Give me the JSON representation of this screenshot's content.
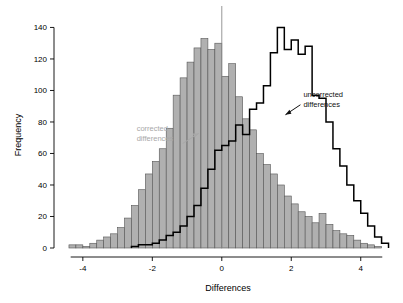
{
  "chart_data": {
    "type": "bar",
    "title": "",
    "xlabel": "Differences",
    "ylabel": "Frequency",
    "xlim": [
      -4.6,
      4.9
    ],
    "ylim": [
      0,
      146
    ],
    "xticks": [
      "-4",
      "-2",
      "0",
      "2",
      "4"
    ],
    "xtick_values": [
      -4,
      -2,
      0,
      2,
      4
    ],
    "yticks": [
      "0",
      "20",
      "40",
      "60",
      "80",
      "100",
      "120",
      "140"
    ],
    "ytick_values": [
      0,
      20,
      40,
      60,
      80,
      100,
      120,
      140
    ],
    "grid": false,
    "legend": "none",
    "annotations": [
      {
        "label": "uncorrected\ndifferences",
        "line1": "uncorrected",
        "line2": "differences",
        "color": "#111111",
        "x": 2.35,
        "y": 96
      },
      {
        "label": "corrected\ndifferences",
        "line1": "corrected",
        "line2": "differences",
        "color": "#a8a8a8",
        "x": -2.45,
        "y": 74
      }
    ],
    "vline": {
      "x": 0,
      "color": "#8c8c8c"
    },
    "series": [
      {
        "name": "corrected differences",
        "style": "filled-bars",
        "color": "#b0b0b0",
        "edge": "#555555",
        "bin_width": 0.2,
        "bin_starts": [
          -4.4,
          -4.2,
          -4.0,
          -3.8,
          -3.6,
          -3.4,
          -3.2,
          -3.0,
          -2.8,
          -2.6,
          -2.4,
          -2.2,
          -2.0,
          -1.8,
          -1.6,
          -1.4,
          -1.2,
          -1.0,
          -0.8,
          -0.6,
          -0.4,
          -0.2,
          0.0,
          0.2,
          0.4,
          0.6,
          0.8,
          1.0,
          1.2,
          1.4,
          1.6,
          1.8,
          2.0,
          2.2,
          2.4,
          2.6,
          2.8,
          3.0,
          3.2,
          3.4,
          3.6,
          3.8,
          4.0,
          4.2,
          4.4
        ],
        "values": [
          2,
          2,
          1,
          3,
          5,
          7,
          9,
          13,
          19,
          27,
          37,
          47,
          55,
          63,
          76,
          97,
          108,
          118,
          127,
          133,
          126,
          130,
          109,
          117,
          96,
          82,
          75,
          60,
          53,
          47,
          40,
          33,
          28,
          23,
          20,
          16,
          22,
          15,
          11,
          9,
          8,
          5,
          3,
          2,
          1
        ]
      },
      {
        "name": "uncorrected differences",
        "style": "step-outline",
        "color": "#000000",
        "bin_width": 0.2,
        "bin_starts": [
          -2.6,
          -2.4,
          -2.2,
          -2.0,
          -1.8,
          -1.6,
          -1.4,
          -1.2,
          -1.0,
          -0.8,
          -0.6,
          -0.4,
          -0.2,
          0.0,
          0.2,
          0.4,
          0.6,
          0.8,
          1.0,
          1.2,
          1.4,
          1.6,
          1.8,
          2.0,
          2.2,
          2.4,
          2.6,
          2.8,
          3.0,
          3.2,
          3.4,
          3.6,
          3.8,
          4.0,
          4.2,
          4.4,
          4.6
        ],
        "values": [
          1,
          2,
          2,
          3,
          5,
          8,
          10,
          14,
          20,
          27,
          38,
          50,
          62,
          65,
          68,
          78,
          72,
          88,
          92,
          103,
          124,
          140,
          126,
          132,
          123,
          128,
          97,
          95,
          80,
          63,
          52,
          40,
          30,
          22,
          14,
          7,
          3
        ]
      }
    ]
  }
}
